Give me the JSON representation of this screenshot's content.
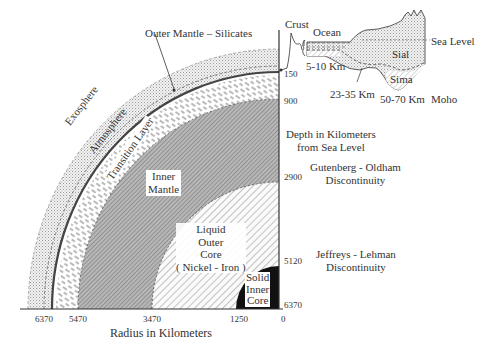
{
  "layers": {
    "exosphere": "Exosphere",
    "atmosphere": "Atmosphere",
    "outer_mantle": "Outer Mantle – Silicates",
    "transition": "Transition Layer",
    "inner_mantle": [
      "Inner",
      "Mantle"
    ],
    "outer_core": [
      "Liquid",
      "Outer",
      "Core",
      "( Nickel - Iron )"
    ],
    "inner_core": [
      "Solid",
      "Inner",
      "Core"
    ]
  },
  "crust_inset": {
    "crust": "Crust",
    "ocean": "Ocean",
    "sea_level": "Sea Level",
    "sial": "Sial",
    "sima": "Sima",
    "ocean_thickness": "5-10 Km",
    "continental_thickness": "23-35 Km",
    "mountain_thickness": "50-70 Km",
    "moho": "Moho"
  },
  "depth_axis": {
    "title": [
      "Depth in Kilometers",
      "from Sea Level"
    ],
    "ticks": [
      "150",
      "900",
      "2900",
      "5120",
      "6370"
    ]
  },
  "discontinuities": {
    "gutenberg": [
      "Gutenberg - Oldham",
      "Discontinuity"
    ],
    "jeffreys": [
      "Jeffreys - Lehman",
      "Discontinuity"
    ]
  },
  "radius_axis": {
    "title": "Radius in Kilometers",
    "ticks": [
      "6370",
      "5470",
      "3470",
      "1250",
      "0"
    ]
  }
}
